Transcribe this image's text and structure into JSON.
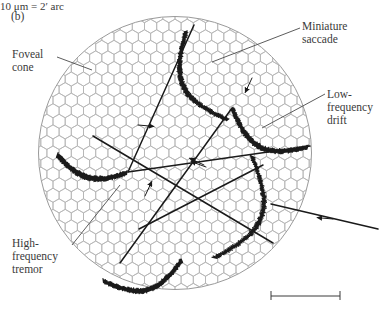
{
  "figure": {
    "panel_label": "(b)",
    "domain": "scientific-figure"
  },
  "labels": {
    "foveal_cone": "Foveal\ncone",
    "miniature_saccade": "Miniature\nsaccade",
    "low_frequency_drift": "Low-\nfrequency\ndrift",
    "high_frequency_tremor": "High-\nfrequency\ntremor"
  },
  "scalebar": {
    "caption": "10 μm = 2′ arc"
  },
  "colors": {
    "mosaic_stroke": "#b4b4b4",
    "circle_stroke": "#9a9a9a",
    "trace_stroke": "#1a1a1a",
    "label_text": "#3a3a3a",
    "leader_line": "#4a4a4a",
    "background": "#ffffff"
  },
  "mosaic": {
    "center_x": 175,
    "center_y": 153,
    "radius": 137,
    "hex_width": 12.2,
    "shape": "flat-top-hexagon"
  },
  "chart_data": {
    "type": "scatter",
    "xlabel": "",
    "ylabel": "",
    "annotations": [
      "Foveal cone",
      "Miniature saccade",
      "Low-frequency drift",
      "High-frequency tremor",
      "10 μm = 2′ arc"
    ],
    "saccades": [
      {
        "name": "saccade-1",
        "x1": 194,
        "y1": 25,
        "x2": 128,
        "y2": 172
      },
      {
        "name": "saccade-2",
        "x1": 128,
        "y1": 172,
        "x2": 310,
        "y2": 146
      },
      {
        "name": "saccade-3",
        "x1": 232,
        "y1": 108,
        "x2": 120,
        "y2": 263
      },
      {
        "name": "saccade-4",
        "x1": 139,
        "y1": 229,
        "x2": 263,
        "y2": 165
      },
      {
        "name": "saccade-5",
        "x1": 93,
        "y1": 136,
        "x2": 273,
        "y2": 243
      },
      {
        "name": "saccade-6",
        "x1": 271,
        "y1": 204,
        "x2": 378,
        "y2": 229
      }
    ],
    "drifts": [
      {
        "name": "drift-top",
        "start": [
          186,
          31
        ],
        "end": [
          228,
          120
        ]
      },
      {
        "name": "drift-right",
        "start": [
          232,
          108
        ],
        "end": [
          308,
          147
        ]
      },
      {
        "name": "drift-bottom",
        "start": [
          252,
          156
        ],
        "end": [
          214,
          258
        ]
      },
      {
        "name": "drift-left",
        "start": [
          57,
          155
        ],
        "end": [
          127,
          173
        ]
      },
      {
        "name": "drift-lower",
        "start": [
          103,
          281
        ],
        "end": [
          182,
          260
        ]
      }
    ],
    "direction_arrows": [
      {
        "x": 138,
        "y": 125,
        "angle": 5
      },
      {
        "x": 252,
        "y": 78,
        "angle": 115
      },
      {
        "x": 204,
        "y": 165,
        "angle": 205
      },
      {
        "x": 145,
        "y": 196,
        "angle": 295
      },
      {
        "x": 206,
        "y": 167,
        "angle": 200
      },
      {
        "x": 333,
        "y": 219,
        "angle": 185
      }
    ]
  }
}
